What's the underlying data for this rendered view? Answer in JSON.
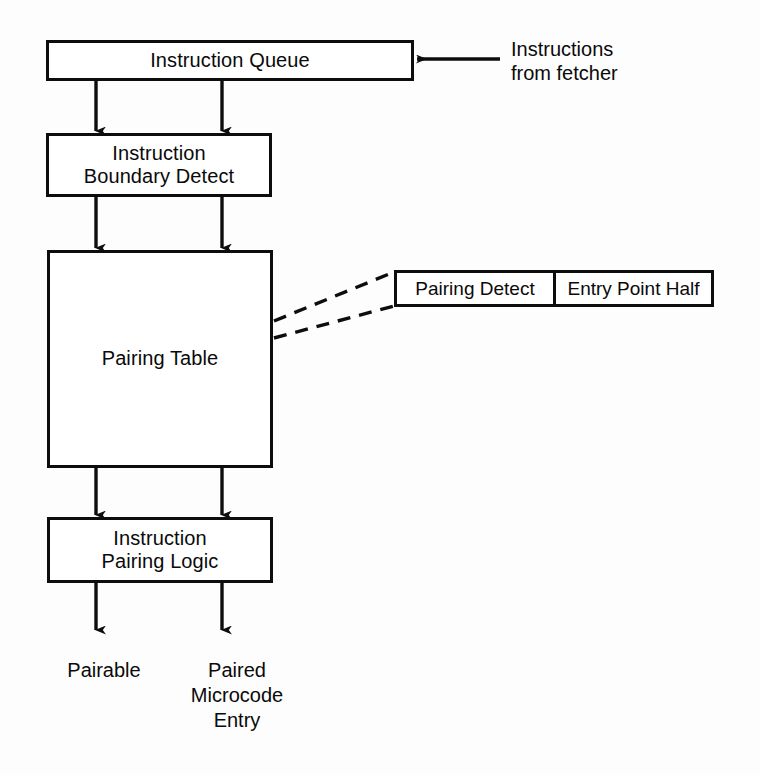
{
  "diagram": {
    "background_color": "#fdfdfd",
    "line_color": "#0d0d0d",
    "nodes": {
      "instruction_queue": {
        "label": "Instruction Queue"
      },
      "boundary_detect": {
        "label": "Instruction\nBoundary Detect"
      },
      "pairing_table": {
        "label": "Pairing Table"
      },
      "pairing_logic": {
        "label": "Instruction\nPairing Logic"
      }
    },
    "callout": {
      "fields": [
        {
          "label": "Pairing Detect"
        },
        {
          "label": "Entry Point Half"
        }
      ]
    },
    "annotations": {
      "input_source": "Instructions\nfrom fetcher"
    },
    "outputs": [
      {
        "label": "Pairable"
      },
      {
        "label": "Paired\nMicrocode\nEntry"
      }
    ]
  }
}
